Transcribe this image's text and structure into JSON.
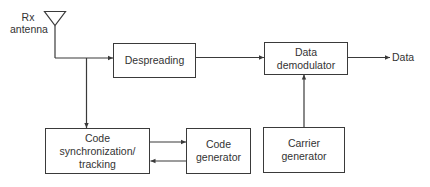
{
  "diagram": {
    "type": "block-diagram",
    "antenna": {
      "label": "Rx\nantenna"
    },
    "blocks": [
      {
        "id": "despreading",
        "label": "Despreading"
      },
      {
        "id": "data-demodulator",
        "label": "Data\ndemodulator"
      },
      {
        "id": "code-sync",
        "label": "Code\nsynchronization/\ntracking"
      },
      {
        "id": "code-generator",
        "label": "Code\ngenerator"
      },
      {
        "id": "carrier-generator",
        "label": "Carrier\ngenerator"
      }
    ],
    "output": {
      "label": "Data"
    },
    "edges": [
      {
        "from": "antenna",
        "to": "despreading"
      },
      {
        "from": "antenna",
        "to": "code-sync"
      },
      {
        "from": "despreading",
        "to": "data-demodulator"
      },
      {
        "from": "data-demodulator",
        "to": "output"
      },
      {
        "from": "carrier-generator",
        "to": "data-demodulator"
      },
      {
        "from": "code-sync",
        "to": "code-generator"
      },
      {
        "from": "code-generator",
        "to": "code-sync"
      }
    ],
    "colors": {
      "line": "#3a3a3a",
      "text": "#333333",
      "background": "#ffffff"
    }
  }
}
